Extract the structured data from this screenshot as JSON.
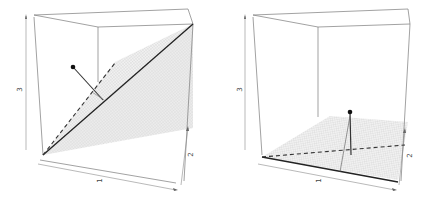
{
  "figure": {
    "panels": [
      {
        "id": "left",
        "description": "3D perspective box with inclined regression plane, solid fitted line, dashed projection line and residual segment from a data point",
        "axes": {
          "x_label": "1",
          "y_label": "2",
          "z_label": "3"
        }
      },
      {
        "id": "right",
        "description": "3D perspective box with horizontal plane near the floor, solid line along front edge, dashed line across plane and vertical segment from a data point",
        "axes": {
          "x_label": "1",
          "y_label": "2",
          "z_label": "3"
        }
      }
    ],
    "colors": {
      "box": "#7a7a7a",
      "plane_mesh": "#cfcfcf",
      "plane_fill": "#ececec",
      "line": "#2a2a2a",
      "point": "#111111"
    }
  }
}
